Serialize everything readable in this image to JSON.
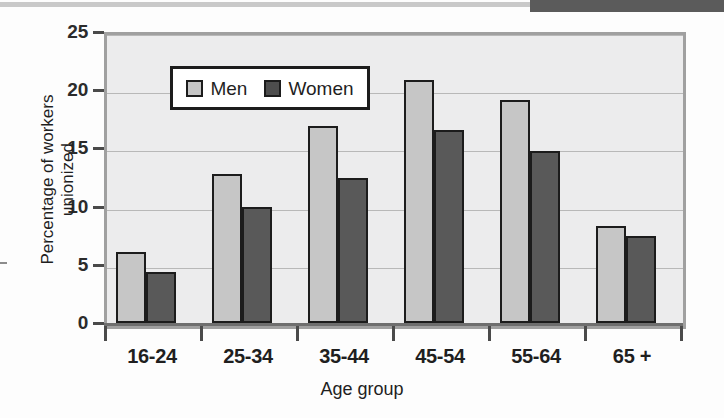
{
  "decor": {
    "top_strip_light_color": "#c9c9c9",
    "top_strip_dark_color": "#5b5b5b"
  },
  "chart_data": {
    "type": "bar",
    "title": "",
    "xlabel": "Age group",
    "ylabel": "Percentage of workers unionized",
    "ylabel_line1": "Percentage of workers",
    "ylabel_line2": "unionized",
    "categories": [
      "16-24",
      "25-34",
      "35-44",
      "45-54",
      "55-64",
      "65 +"
    ],
    "series": [
      {
        "name": "Men",
        "color": "#c6c6c6",
        "values": [
          6.1,
          12.8,
          16.9,
          20.9,
          19.2,
          8.3
        ]
      },
      {
        "name": "Women",
        "color": "#595959",
        "values": [
          4.4,
          10.0,
          12.5,
          16.6,
          14.8,
          7.5
        ]
      }
    ],
    "ylim": [
      0,
      25
    ],
    "yticks": [
      0,
      5,
      10,
      15,
      20,
      25
    ],
    "ytick_labels": [
      "0",
      "5",
      "10",
      "15",
      "20",
      "25"
    ],
    "grid": true,
    "legend_position": "upper-left-inside",
    "plot_background": "#ececed",
    "gridline_color": "#b8b8b8"
  }
}
